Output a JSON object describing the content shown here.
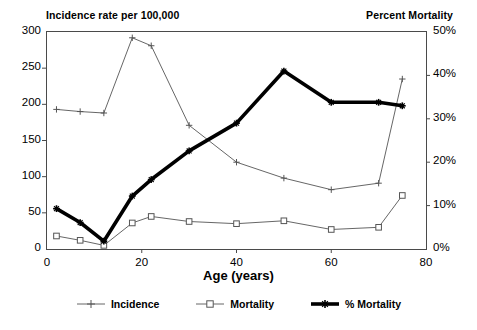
{
  "header": {
    "left_title": "Incidence rate per 100,000",
    "right_title": "Percent Mortality"
  },
  "axes": {
    "x_title": "Age (years)",
    "x_ticks": [
      "0",
      "20",
      "40",
      "60",
      "80"
    ],
    "y_left_ticks": [
      "300",
      "250",
      "200",
      "150",
      "100",
      "50",
      "0"
    ],
    "y_right_ticks": [
      "50%",
      "40%",
      "30%",
      "20%",
      "10%",
      "0%"
    ]
  },
  "legend": {
    "items": [
      {
        "label": "Incidence",
        "marker": "plus-marker",
        "color": "#555555"
      },
      {
        "label": "Mortality",
        "marker": "square-marker",
        "color": "#555555"
      },
      {
        "label": "% Mortality",
        "marker": "thick-line-marker",
        "color": "#000000"
      }
    ]
  },
  "chart_data": {
    "type": "line",
    "title": "",
    "xlabel": "Age (years)",
    "ylabel": "Incidence rate per 100,000",
    "y2label": "Percent Mortality",
    "xlim": [
      0,
      80
    ],
    "ylim": [
      0,
      300
    ],
    "y2lim": [
      0,
      50
    ],
    "grid": false,
    "legend_position": "bottom",
    "series": [
      {
        "name": "Incidence",
        "axis": "left",
        "marker": "plus",
        "color": "#555555",
        "x": [
          2,
          7,
          12,
          18,
          22,
          30,
          40,
          50,
          60,
          70,
          75
        ],
        "y": [
          193,
          190,
          188,
          292,
          281,
          171,
          120,
          98,
          82,
          91,
          235
        ]
      },
      {
        "name": "Mortality",
        "axis": "left",
        "marker": "square",
        "color": "#555555",
        "x": [
          2,
          7,
          12,
          18,
          22,
          30,
          40,
          50,
          60,
          70,
          75
        ],
        "y": [
          18,
          12,
          5,
          36,
          45,
          38,
          35,
          39,
          27,
          30,
          74
        ]
      },
      {
        "name": "% Mortality",
        "axis": "right",
        "marker": "star",
        "color": "#000000",
        "x": [
          2,
          7,
          12,
          18,
          22,
          30,
          40,
          50,
          60,
          70,
          75
        ],
        "y": [
          9.3,
          6.1,
          1.8,
          12.2,
          16.0,
          22.6,
          29.0,
          41.0,
          33.8,
          33.8,
          33.0
        ]
      }
    ]
  }
}
